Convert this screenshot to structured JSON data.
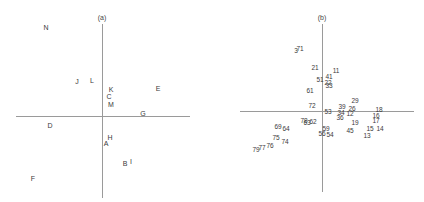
{
  "chart_data": [
    {
      "type": "scatter",
      "title": "(a)",
      "xlabel": "",
      "ylabel": "",
      "grid": false,
      "axes": "centered cross at origin",
      "xlim": [
        -1,
        1
      ],
      "ylim": [
        -1,
        1
      ],
      "points": [
        {
          "label": "N",
          "x": -0.59,
          "y": 0.88
        },
        {
          "label": "J",
          "x": -0.28,
          "y": 0.27
        },
        {
          "label": "L",
          "x": -0.13,
          "y": 0.28
        },
        {
          "label": "K",
          "x": 0.08,
          "y": 0.21
        },
        {
          "label": "E",
          "x": 0.56,
          "y": 0.22
        },
        {
          "label": "C",
          "x": 0.06,
          "y": 0.15
        },
        {
          "label": "M",
          "x": 0.08,
          "y": 0.07
        },
        {
          "label": "G",
          "x": 0.42,
          "y": -0.02
        },
        {
          "label": "D",
          "x": -0.51,
          "y": -0.12
        },
        {
          "label": "H",
          "x": 0.07,
          "y": -0.24
        },
        {
          "label": "A",
          "x": 0.03,
          "y": -0.3
        },
        {
          "label": "B",
          "x": 0.23,
          "y": -0.5
        },
        {
          "label": "I",
          "x": 0.29,
          "y": -0.48
        },
        {
          "label": "F",
          "x": -0.71,
          "y": -0.66
        }
      ]
    },
    {
      "type": "scatter",
      "title": "(b)",
      "xlabel": "",
      "ylabel": "",
      "grid": false,
      "axes": "centered cross at origin",
      "xlim": [
        -1,
        1
      ],
      "ylim": [
        -1,
        1
      ],
      "points": [
        {
          "label": "3",
          "x": -0.3,
          "y": 0.66
        },
        {
          "label": "71",
          "x": -0.26,
          "y": 0.68
        },
        {
          "label": "21",
          "x": -0.1,
          "y": 0.47
        },
        {
          "label": "11",
          "x": 0.12,
          "y": 0.43
        },
        {
          "label": "41",
          "x": 0.05,
          "y": 0.38
        },
        {
          "label": "51",
          "x": -0.05,
          "y": 0.35
        },
        {
          "label": "22",
          "x": 0.04,
          "y": 0.33
        },
        {
          "label": "33",
          "x": 0.05,
          "y": 0.31
        },
        {
          "label": "61",
          "x": -0.14,
          "y": 0.24
        },
        {
          "label": "29",
          "x": 0.33,
          "y": 0.12
        },
        {
          "label": "72",
          "x": -0.09,
          "y": 0.06
        },
        {
          "label": "39",
          "x": 0.18,
          "y": 0.07
        },
        {
          "label": "26",
          "x": 0.31,
          "y": 0.05
        },
        {
          "label": "53",
          "x": 0.04,
          "y": 0.01
        },
        {
          "label": "34",
          "x": 0.17,
          "y": 0.01
        },
        {
          "label": "12",
          "x": 0.28,
          "y": 0.0
        },
        {
          "label": "18",
          "x": 0.57,
          "y": 0.02
        },
        {
          "label": "16",
          "x": 0.53,
          "y": -0.03
        },
        {
          "label": "36",
          "x": 0.16,
          "y": -0.04
        },
        {
          "label": "17",
          "x": 0.53,
          "y": -0.08
        },
        {
          "label": "19",
          "x": 0.32,
          "y": -0.07
        },
        {
          "label": "78",
          "x": -0.2,
          "y": -0.07
        },
        {
          "label": "63",
          "x": -0.17,
          "y": -0.09
        },
        {
          "label": "62",
          "x": -0.11,
          "y": -0.08
        },
        {
          "label": "15",
          "x": 0.48,
          "y": -0.15
        },
        {
          "label": "14",
          "x": 0.56,
          "y": -0.16
        },
        {
          "label": "45",
          "x": 0.25,
          "y": -0.17
        },
        {
          "label": "13",
          "x": 0.42,
          "y": -0.22
        },
        {
          "label": "59",
          "x": 0.03,
          "y": -0.16
        },
        {
          "label": "54",
          "x": 0.05,
          "y": -0.2
        },
        {
          "label": "56",
          "x": -0.02,
          "y": -0.2
        },
        {
          "label": "69",
          "x": -0.45,
          "y": -0.14
        },
        {
          "label": "64",
          "x": -0.38,
          "y": -0.16
        },
        {
          "label": "75",
          "x": -0.45,
          "y": -0.23
        },
        {
          "label": "74",
          "x": -0.4,
          "y": -0.26
        },
        {
          "label": "76",
          "x": -0.53,
          "y": -0.31
        },
        {
          "label": "77",
          "x": -0.62,
          "y": -0.33
        },
        {
          "label": "79",
          "x": -0.68,
          "y": -0.35
        }
      ]
    }
  ],
  "panels": {
    "a": {
      "title": "(a)",
      "labels": [
        "N",
        "J",
        "L",
        "K",
        "E",
        "C",
        "M",
        "G",
        "D",
        "H",
        "A",
        "B",
        "I",
        "F"
      ],
      "positions": [
        [
          46,
          27
        ],
        [
          77,
          81
        ],
        [
          92,
          80
        ],
        [
          111,
          89
        ],
        [
          158,
          88
        ],
        [
          109,
          96
        ],
        [
          111,
          104
        ],
        [
          143,
          113
        ],
        [
          50,
          125
        ],
        [
          110,
          137
        ],
        [
          106,
          143
        ],
        [
          125,
          163
        ],
        [
          131,
          161
        ],
        [
          33,
          178
        ]
      ]
    },
    "b": {
      "title": "(b)",
      "labels": [
        "3",
        "71",
        "21",
        "11",
        "41",
        "51",
        "22",
        "33",
        "61",
        "29",
        "72",
        "39",
        "26",
        "53",
        "34",
        "12",
        "18",
        "16",
        "36",
        "17",
        "19",
        "78",
        "63",
        "62",
        "15",
        "14",
        "45",
        "13",
        "59",
        "54",
        "56",
        "69",
        "64",
        "75",
        "74",
        "76",
        "77",
        "79"
      ],
      "positions": [
        [
          84,
          50
        ],
        [
          88,
          48
        ],
        [
          103,
          67
        ],
        [
          124,
          70
        ],
        [
          117,
          76
        ],
        [
          108,
          79
        ],
        [
          116,
          82
        ],
        [
          117,
          85
        ],
        [
          98,
          90
        ],
        [
          143,
          100
        ],
        [
          100,
          105
        ],
        [
          130,
          106
        ],
        [
          140,
          108
        ],
        [
          116,
          111
        ],
        [
          129,
          112
        ],
        [
          138,
          113
        ],
        [
          167,
          109
        ],
        [
          164,
          115
        ],
        [
          128,
          117
        ],
        [
          164,
          120
        ],
        [
          143,
          122
        ],
        [
          92,
          120
        ],
        [
          95,
          122
        ],
        [
          101,
          121
        ],
        [
          158,
          128
        ],
        [
          168,
          128
        ],
        [
          138,
          130
        ],
        [
          155,
          135
        ],
        [
          114,
          128
        ],
        [
          118,
          134
        ],
        [
          110,
          133
        ],
        [
          66,
          126
        ],
        [
          74,
          128
        ],
        [
          64,
          137
        ],
        [
          73,
          141
        ],
        [
          58,
          145
        ],
        [
          50,
          147
        ],
        [
          44,
          149
        ]
      ]
    }
  }
}
